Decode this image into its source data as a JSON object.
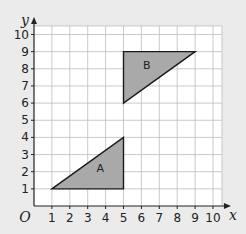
{
  "diagram": {
    "type": "coordinate-grid",
    "axes": {
      "x_label": "x",
      "y_label": "y",
      "origin_label": "O",
      "x_ticks": [
        "1",
        "2",
        "3",
        "4",
        "5",
        "6",
        "7",
        "8",
        "9",
        "10"
      ],
      "y_ticks": [
        "1",
        "2",
        "3",
        "4",
        "5",
        "6",
        "7",
        "8",
        "9",
        "10"
      ],
      "range": [
        0,
        10.5
      ]
    },
    "shapes": [
      {
        "label": "A",
        "vertices": [
          [
            1,
            1
          ],
          [
            5,
            1
          ],
          [
            5,
            4
          ]
        ],
        "label_pos": [
          3.7,
          2.2
        ]
      },
      {
        "label": "B",
        "vertices": [
          [
            5,
            9
          ],
          [
            9,
            9
          ],
          [
            5,
            6
          ]
        ],
        "label_pos": [
          6.3,
          8.2
        ]
      }
    ],
    "colors": {
      "background": "#ebebeb",
      "plot_area": "#ffffff",
      "grid": "#bdbdbd",
      "shape_fill": "#a9a9a9",
      "shape_stroke": "#1a1a1a",
      "axis": "#222222"
    }
  }
}
